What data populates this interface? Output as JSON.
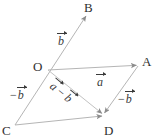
{
  "figure": {
    "type": "vector-parallelogram-diagram",
    "background_color": "#ffffff",
    "line_color": "#b0b0b0",
    "text_color": "#303030",
    "width": 154,
    "height": 140,
    "points": [
      {
        "id": "O",
        "label": "O",
        "x": 48,
        "y": 70
      },
      {
        "id": "A",
        "label": "A",
        "x": 138,
        "y": 65
      },
      {
        "id": "B",
        "label": "B",
        "x": 88,
        "y": 13
      },
      {
        "id": "C",
        "label": "C",
        "x": 15,
        "y": 125
      },
      {
        "id": "D",
        "label": "D",
        "x": 103,
        "y": 115
      }
    ],
    "vectors": [
      {
        "id": "b-upper",
        "label_minus": "",
        "label_letter": "b",
        "from": "O",
        "to": "B",
        "arrow": true,
        "description": "vector b from O to B"
      },
      {
        "id": "a-top",
        "label_minus": "",
        "label_letter": "a",
        "from": "O",
        "to": "A",
        "arrow": true,
        "description": "vector a from O to A"
      },
      {
        "id": "minus-b-left",
        "label_minus": "−",
        "label_letter": "b",
        "from": "O",
        "to": "C",
        "arrow": true,
        "description": "vector minus b from O to C"
      },
      {
        "id": "minus-b-right",
        "label_minus": "−",
        "label_letter": "b",
        "from": "A",
        "to": "D",
        "arrow": true,
        "description": "vector minus b from A to D"
      },
      {
        "id": "a-minus-b-diagonal",
        "label_minus": "",
        "label_letter": "a",
        "label_operator": "−",
        "label_letter2": "b",
        "from": "O",
        "to": "D",
        "arrow": true,
        "description": "diagonal vector a minus b from O to D"
      }
    ],
    "edges": [
      {
        "id": "edge-C-B",
        "from": "C",
        "to": "B"
      },
      {
        "id": "edge-O-A",
        "from": "O",
        "to": "A"
      },
      {
        "id": "edge-A-D",
        "from": "A",
        "to": "D"
      },
      {
        "id": "edge-C-D",
        "from": "C",
        "to": "D"
      },
      {
        "id": "edge-O-D",
        "from": "O",
        "to": "D"
      }
    ],
    "labels": {
      "point_O": "O",
      "point_A": "A",
      "point_B": "B",
      "point_C": "C",
      "point_D": "D",
      "vec_b_upper": "b",
      "vec_a": "a",
      "vec_minus_b_left_sign": "−",
      "vec_minus_b_left": "b",
      "vec_minus_b_right_sign": "−",
      "vec_minus_b_right": "b",
      "diag_a": "a",
      "diag_minus": "−",
      "diag_b": "b"
    }
  }
}
